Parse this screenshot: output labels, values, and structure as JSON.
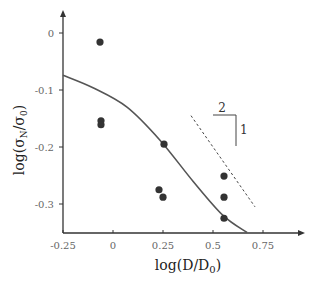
{
  "chart_data": {
    "type": "scatter",
    "title": "",
    "xlabel": "log(D/D₀)",
    "ylabel": "log(σ_N/σ₀)",
    "xlim": [
      -0.25,
      0.9
    ],
    "ylim": [
      -0.35,
      0.03
    ],
    "grid": false,
    "legend": null,
    "x_ticks": [
      -0.25,
      0,
      0.25,
      0.5,
      0.75
    ],
    "x_tick_labels": [
      "-0.25",
      "0",
      "0.25",
      "0.5",
      "0.75"
    ],
    "y_ticks": [
      0,
      -0.1,
      -0.2,
      -0.3
    ],
    "y_tick_labels": [
      "0",
      "-0.1",
      "-0.2",
      "-0.3"
    ],
    "series": [
      {
        "name": "experimental data",
        "kind": "scatter",
        "color": "#333333",
        "points": [
          {
            "x": -0.065,
            "y": -0.016
          },
          {
            "x": -0.06,
            "y": -0.154
          },
          {
            "x": -0.06,
            "y": -0.161
          },
          {
            "x": 0.255,
            "y": -0.195
          },
          {
            "x": 0.23,
            "y": -0.275
          },
          {
            "x": 0.25,
            "y": -0.288
          },
          {
            "x": 0.555,
            "y": -0.251
          },
          {
            "x": 0.555,
            "y": -0.288
          },
          {
            "x": 0.555,
            "y": -0.325
          }
        ]
      },
      {
        "name": "size effect law fit",
        "kind": "line",
        "color": "#555555",
        "points": [
          {
            "x": -0.25,
            "y": -0.074
          },
          {
            "x": -0.1,
            "y": -0.096
          },
          {
            "x": 0.07,
            "y": -0.13
          },
          {
            "x": 0.235,
            "y": -0.188
          },
          {
            "x": 0.4,
            "y": -0.26
          },
          {
            "x": 0.55,
            "y": -0.32
          },
          {
            "x": 0.67,
            "y": -0.35
          }
        ]
      },
      {
        "name": "asymptote slope -1/2",
        "kind": "dashed-line",
        "color": "#444444",
        "points": [
          {
            "x": 0.39,
            "y": -0.145
          },
          {
            "x": 0.71,
            "y": -0.305
          }
        ]
      }
    ],
    "annotations": [
      {
        "text": "2",
        "meaning": "slope triangle horizontal leg"
      },
      {
        "text": "1",
        "meaning": "slope triangle vertical leg"
      }
    ]
  },
  "labels": {
    "x_axis": "log(D/D",
    "x_axis_sub": "0",
    "y_axis_prefix": "log(σ",
    "y_axis_sub1": "N",
    "y_axis_mid": "/σ",
    "y_axis_sub2": "0",
    "slope_run": "2",
    "slope_rise": "1"
  }
}
